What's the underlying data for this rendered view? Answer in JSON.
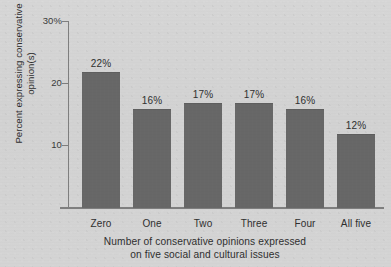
{
  "chart_data": {
    "type": "bar",
    "title": "",
    "subtitle": "",
    "categories": [
      "Zero",
      "One",
      "Two",
      "Three",
      "Four",
      "All five"
    ],
    "values": [
      22,
      16,
      17,
      17,
      16,
      12
    ],
    "value_labels": [
      "22%",
      "16%",
      "17%",
      "17%",
      "16%",
      "12%"
    ],
    "xlabel": "Number of conservative opinions expressed on five social and cultural issues",
    "xlabel_line1": "Number of conservative opinions expressed",
    "xlabel_line2": "on five social and cultural issues",
    "ylabel": "Percent expressing conservative opinion(s)",
    "ylabel_line1": "Percent expressing conservative",
    "ylabel_line2": "opinion(s)",
    "ylim": [
      0,
      30
    ],
    "yticks": [
      10,
      20,
      30
    ],
    "ytick_labels": [
      "10",
      "20",
      "30%"
    ],
    "grid": false,
    "legend": false,
    "bar_color": "#676767",
    "background_color": "#d3d3d3",
    "text_color": "#2f2f2f",
    "axis_color": "#7e7e7e"
  }
}
